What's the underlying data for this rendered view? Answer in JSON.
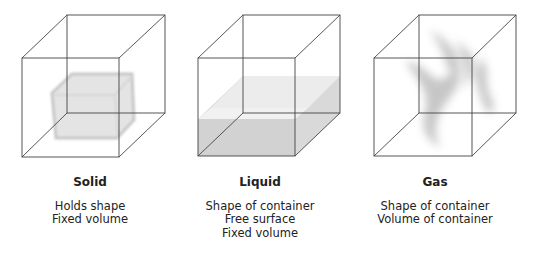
{
  "figure": {
    "panels": [
      {
        "id": "solid",
        "title": "Solid",
        "properties": [
          "Holds shape",
          "Fixed volume"
        ]
      },
      {
        "id": "liquid",
        "title": "Liquid",
        "properties": [
          "Shape of container",
          "Free surface",
          "Fixed volume"
        ]
      },
      {
        "id": "gas",
        "title": "Gas",
        "properties": [
          "Shape of container",
          "Volume of container"
        ]
      }
    ],
    "colors": {
      "line": "#444444",
      "fill": "#cfcfcf",
      "background": "#ffffff"
    }
  }
}
